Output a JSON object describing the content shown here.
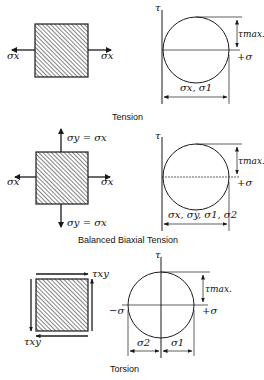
{
  "panels": [
    {
      "id": "tension",
      "caption": "Tension",
      "element_labels": {
        "left": "σx",
        "right": "σx"
      },
      "mohr": {
        "axis_tau": "τ",
        "tau_max": "τmax.",
        "plus_sigma": "+σ",
        "dimension_label": "σx, σ1"
      }
    },
    {
      "id": "balanced-biaxial-tension",
      "caption": "Balanced Biaxial Tension",
      "element_labels": {
        "left": "σx",
        "right": "σx",
        "top": "σy = σx",
        "bottom": "σy = σx"
      },
      "mohr": {
        "axis_tau": "τ",
        "tau_max": "τmax.",
        "plus_sigma": "+σ",
        "dimension_label": "σx, σy, σ1, σ2"
      }
    },
    {
      "id": "torsion",
      "caption": "Torsion",
      "element_labels": {
        "top_right": "τxy",
        "bottom_left": "τxy"
      },
      "mohr": {
        "axis_tau": "τ",
        "tau_max": "τmax.",
        "plus_sigma": "+σ",
        "minus_sigma": "−σ",
        "dimension_left": "σ2",
        "dimension_right": "σ1"
      }
    }
  ],
  "colors": {
    "ink": "#1a1a1a",
    "background": "#ffffff"
  }
}
